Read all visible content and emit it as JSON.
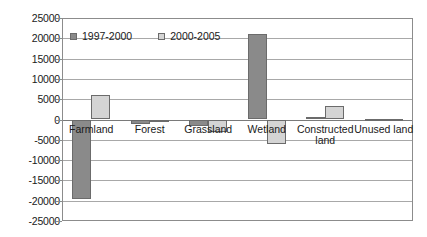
{
  "chart_data": {
    "type": "bar",
    "title": "",
    "subtitle": "",
    "xlabel": "",
    "ylabel": "",
    "ylim": [
      -25000,
      25000
    ],
    "ytick_step": 5000,
    "yticks": [
      25000,
      20000,
      15000,
      10000,
      5000,
      0,
      -5000,
      -10000,
      -15000,
      -20000,
      -25000
    ],
    "ytick_labels": [
      "25000",
      "20000",
      "15000",
      "10000",
      "5000",
      "0",
      "-5000",
      "-10000",
      "-15000",
      "-20000",
      "-25000"
    ],
    "grid": true,
    "legend_position": "top-left-inside",
    "categories": [
      "Farmland",
      "Forest",
      "Grassland",
      "Wetland",
      "Constructed\nland",
      "Unused land"
    ],
    "series": [
      {
        "name": "1997-2000",
        "color": "#8a8a8a",
        "values": [
          -19500,
          -1000,
          -1500,
          21000,
          700,
          150
        ]
      },
      {
        "name": "2000-2005",
        "color": "#d4d4d4",
        "values": [
          6000,
          -400,
          -3000,
          -6100,
          3400,
          200
        ]
      }
    ]
  },
  "legend": {
    "items": [
      {
        "label": "1997-2000",
        "swatch": "dark-gray-swatch-icon"
      },
      {
        "label": "2000-2005",
        "swatch": "light-gray-swatch-icon"
      }
    ]
  },
  "colors": {
    "series_1997_2000": "#8a8a8a",
    "series_2000_2005": "#d4d4d4",
    "bar_outline": "#6b6b6b",
    "gridline": "#a8a8a8",
    "frame": "#8c8c8c",
    "text": "#1a1a1a",
    "background": "#ffffff"
  }
}
